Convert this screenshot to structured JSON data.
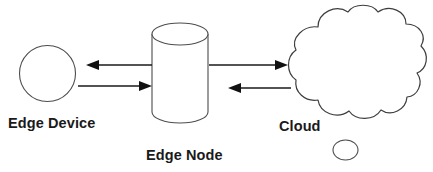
{
  "diagram": {
    "background_color": "#ffffff",
    "stroke_color": "#4d4d4d",
    "arrow_color": "#111111",
    "text_color": "#1a1a1a",
    "nodes": [
      {
        "id": "edge-device",
        "label": "Edge Device",
        "shape": "circle",
        "label_x": 8,
        "label_y": 128
      },
      {
        "id": "edge-node",
        "label": "Edge Node",
        "shape": "cylinder",
        "label_x": 146,
        "label_y": 160
      },
      {
        "id": "cloud",
        "label": "Cloud",
        "shape": "cloud",
        "label_x": 279,
        "label_y": 131
      }
    ],
    "connections": [
      {
        "id": "node-to-device",
        "from": "edge-node",
        "to": "edge-device",
        "direction": "left"
      },
      {
        "id": "device-to-node",
        "from": "edge-device",
        "to": "edge-node",
        "direction": "right"
      },
      {
        "id": "node-to-cloud",
        "from": "edge-node",
        "to": "cloud",
        "direction": "right"
      },
      {
        "id": "cloud-to-node",
        "from": "cloud",
        "to": "edge-node",
        "direction": "left"
      }
    ]
  }
}
